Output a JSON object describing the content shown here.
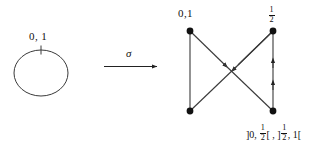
{
  "figure": {
    "kind": "commutative-diagram"
  },
  "source": {
    "shape": "circle",
    "tick_label": "0, 1",
    "circle": {
      "cx": 41,
      "cy": 73,
      "rx": 27,
      "ry": 23
    },
    "tick": {
      "x": 41,
      "y1": 46,
      "y2": 54
    }
  },
  "map": {
    "symbol": "σ",
    "arrow": {
      "x1": 104,
      "y1": 66,
      "x2": 160,
      "y2": 66
    }
  },
  "graph": {
    "nodes": [
      {
        "id": "tl",
        "x": 190,
        "y": 31,
        "label": "0,1",
        "label_pos": "above-left"
      },
      {
        "id": "tr",
        "x": 273,
        "y": 31,
        "label": "1/2",
        "label_pos": "above"
      },
      {
        "id": "bl",
        "x": 190,
        "y": 111,
        "label": "",
        "label_pos": ""
      },
      {
        "id": "br",
        "x": 273,
        "y": 111,
        "label": "",
        "label_pos": ""
      }
    ],
    "edges": [
      {
        "from": "tl",
        "to": "bl",
        "arrows": 0,
        "style": "vertical-left"
      },
      {
        "from": "tl",
        "to": "br",
        "arrows": 1,
        "style": "diagonal-down-right"
      },
      {
        "from": "tr",
        "to": "bl",
        "arrows": 1,
        "style": "diagonal-down-left"
      },
      {
        "from": "br",
        "to": "tr",
        "arrows": 2,
        "style": "vertical-right-upward"
      }
    ],
    "labels": {
      "top_left": "0,1",
      "top_right_numerator": "1",
      "top_right_denominator": "2",
      "bottom_interval": "]0, 1/2[ , ]1/2, 1["
    }
  },
  "colors": {
    "ink": "#111111",
    "line": "#3c3c3c",
    "background": "#ffffff"
  }
}
